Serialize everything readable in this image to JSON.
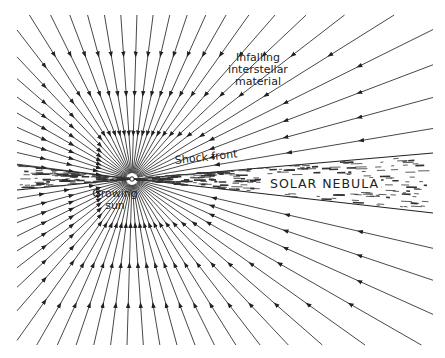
{
  "diagram": {
    "labels": {
      "infalling_line1": "Infalling",
      "infalling_line2": "interstellar",
      "infalling_line3": "material",
      "shock_front": "Shock front",
      "solar_nebula": "SOLAR NEBULA",
      "growing_line1": "Growing",
      "growing_line2": "sun"
    },
    "colors": {
      "ink": "#222222",
      "background": "#ffffff"
    }
  }
}
